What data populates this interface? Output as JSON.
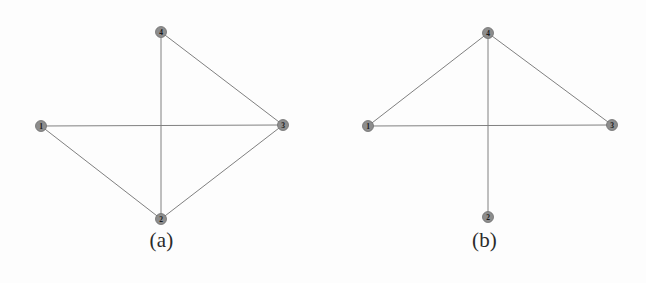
{
  "figure": {
    "background_color": "#fdfdfd",
    "edge_color": "#808080",
    "node_fill_color": "#8d8d8d",
    "node_stroke_color": "#6f6f6f",
    "node_label_color": "#1a1a1a",
    "node_radius": 5.5,
    "edge_width": 1
  },
  "panels": [
    {
      "id": "a",
      "caption": "(a)",
      "nodes": [
        {
          "label": "4",
          "x": 161,
          "y": 32
        },
        {
          "label": "1",
          "x": 41,
          "y": 126
        },
        {
          "label": "3",
          "x": 283,
          "y": 125
        },
        {
          "label": "2",
          "x": 161,
          "y": 219
        }
      ],
      "edges": [
        {
          "from": "4",
          "to": "2"
        },
        {
          "from": "4",
          "to": "3"
        },
        {
          "from": "1",
          "to": "3"
        },
        {
          "from": "1",
          "to": "2"
        },
        {
          "from": "2",
          "to": "3"
        }
      ]
    },
    {
      "id": "b",
      "caption": "(b)",
      "nodes": [
        {
          "label": "4",
          "x": 165,
          "y": 33
        },
        {
          "label": "1",
          "x": 45,
          "y": 126
        },
        {
          "label": "3",
          "x": 289,
          "y": 125
        },
        {
          "label": "2",
          "x": 165,
          "y": 217
        }
      ],
      "edges": [
        {
          "from": "4",
          "to": "1"
        },
        {
          "from": "4",
          "to": "3"
        },
        {
          "from": "4",
          "to": "2"
        },
        {
          "from": "1",
          "to": "3"
        }
      ]
    }
  ],
  "chart_data": {
    "type": "diagram",
    "title": "",
    "graphs": [
      {
        "name": "(a)",
        "vertices": [
          "1",
          "2",
          "3",
          "4"
        ],
        "edges": [
          [
            "4",
            "2"
          ],
          [
            "4",
            "3"
          ],
          [
            "1",
            "3"
          ],
          [
            "1",
            "2"
          ],
          [
            "2",
            "3"
          ]
        ],
        "degree": {
          "1": 2,
          "2": 3,
          "3": 3,
          "4": 2
        },
        "edge_count": 5
      },
      {
        "name": "(b)",
        "vertices": [
          "1",
          "2",
          "3",
          "4"
        ],
        "edges": [
          [
            "4",
            "1"
          ],
          [
            "4",
            "3"
          ],
          [
            "4",
            "2"
          ],
          [
            "1",
            "3"
          ]
        ],
        "degree": {
          "1": 2,
          "2": 1,
          "3": 2,
          "4": 3
        },
        "edge_count": 4
      }
    ]
  }
}
